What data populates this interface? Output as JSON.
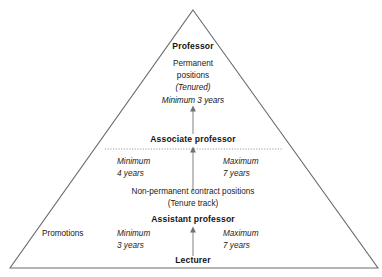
{
  "diagram": {
    "type": "pyramid-hierarchy",
    "shape": {
      "apex": [
        193,
        10
      ],
      "base_left": [
        10,
        268
      ],
      "base_right": [
        378,
        268
      ],
      "stroke_color": "#6b6b6b",
      "background": "#ffffff"
    },
    "divider": {
      "style": "dotted",
      "color": "#8a8a8a",
      "y": 149,
      "x_start": 105,
      "x_end": 282
    },
    "ranks": {
      "professor": "Professor",
      "associate_professor": "Associate professor",
      "assistant_professor": "Assistant professor",
      "lecturer": "Lecturer"
    },
    "top_block": {
      "line1": "Permanent",
      "line2": "positions",
      "line3": "(Tenured)"
    },
    "middle_block": {
      "line1": "Non-permanent contract positions",
      "line2": "(Tenure track)"
    },
    "durations": {
      "professor_entry": "Minimum 3 years",
      "associate_min_l1": "Minimum",
      "associate_min_l2": "4 years",
      "associate_max_l1": "Maximum",
      "associate_max_l2": "7 years",
      "assistant_min_l1": "Minimum",
      "assistant_min_l2": "3 years",
      "assistant_max_l1": "Maximum",
      "assistant_max_l2": "7 years"
    },
    "side_label": {
      "promotions": "Promotions"
    },
    "arrows": [
      {
        "name": "arrow-to-professor",
        "x": 193,
        "y_tail": 134,
        "y_head": 107
      },
      {
        "name": "arrow-to-associate-professor",
        "x": 193,
        "y_tail": 192,
        "y_head": 148
      },
      {
        "name": "arrow-to-assistant-professor",
        "x": 193,
        "y_tail": 256,
        "y_head": 228
      }
    ]
  }
}
